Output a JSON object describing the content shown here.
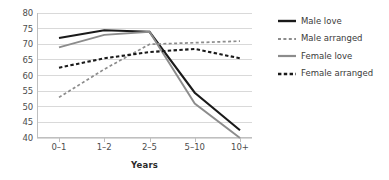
{
  "chart_data": {
    "type": "line",
    "title": "",
    "xlabel": "Years",
    "ylabel": "",
    "categories": [
      "0–1",
      "1–2",
      "2–5",
      "5–10",
      "10+"
    ],
    "ylim": [
      40,
      80
    ],
    "yticks": [
      40,
      45,
      50,
      55,
      60,
      65,
      70,
      75,
      80
    ],
    "grid": true,
    "legend_position": "right",
    "series": [
      {
        "name": "Male love",
        "values": [
          72,
          74.5,
          74,
          54.5,
          42.5
        ],
        "color": "#1a1a1a",
        "style": "solid",
        "width": 2.1
      },
      {
        "name": "Male arranged",
        "values": [
          53,
          62,
          70,
          70.5,
          71
        ],
        "color": "#8c8c8c",
        "style": "dashed",
        "width": 1.7
      },
      {
        "name": "Female love",
        "values": [
          69,
          73,
          74,
          51,
          40
        ],
        "color": "#8c8c8c",
        "style": "solid",
        "width": 1.9
      },
      {
        "name": "Female arranged",
        "values": [
          62.5,
          65.5,
          67.5,
          68.5,
          65.5
        ],
        "color": "#1a1a1a",
        "style": "dashed",
        "width": 2.1
      }
    ]
  },
  "axis": {
    "y_tick_labels": [
      "80",
      "75",
      "70",
      "65",
      "60",
      "55",
      "50",
      "45",
      "40"
    ],
    "x_tick_labels": [
      "0–1",
      "1–2",
      "2–5",
      "5–10",
      "10+"
    ],
    "x_title": "Years"
  },
  "legend": {
    "items": [
      {
        "label": "Male love",
        "icon": "solid-line-swatch"
      },
      {
        "label": "Male arranged",
        "icon": "dashed-line-swatch"
      },
      {
        "label": "Female love",
        "icon": "solid-line-swatch"
      },
      {
        "label": "Female arranged",
        "icon": "dashed-line-swatch"
      }
    ]
  },
  "colors": {
    "dark_series": "#1a1a1a",
    "gray_series": "#8c8c8c",
    "gridline": "#d9d9d9",
    "axis_line": "#bfbfbf",
    "tick_text": "#4d4d4d"
  }
}
